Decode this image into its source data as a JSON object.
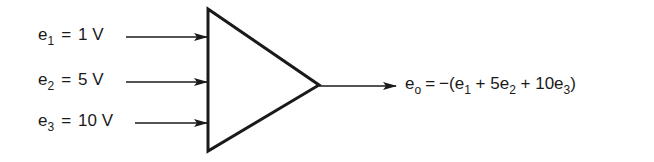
{
  "diagram": {
    "type": "summing-amplifier",
    "inputs": [
      {
        "symbol": "e",
        "subscript": "1",
        "equals": "=",
        "value": "1 V"
      },
      {
        "symbol": "e",
        "subscript": "2",
        "equals": "=",
        "value": "5 V"
      },
      {
        "symbol": "e",
        "subscript": "3",
        "equals": "=",
        "value": "10 V"
      }
    ],
    "output": {
      "symbol": "e",
      "subscript": "o",
      "equals": "=",
      "expr_prefix": "−(e",
      "term1_sub": "1",
      "plus1": " + 5e",
      "term2_sub": "2",
      "plus2": " + 10e",
      "term3_sub": "3",
      "expr_suffix": ")"
    },
    "colors": {
      "line": "#1a1a1a",
      "background": "#ffffff"
    }
  }
}
